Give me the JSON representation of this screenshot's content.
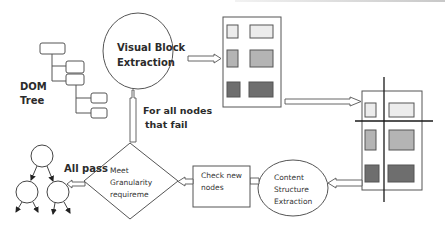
{
  "diagram": {
    "labels": {
      "dom_tree_line1": "DOM",
      "dom_tree_line2": "Tree",
      "visual_block_line1": "Visual Block",
      "visual_block_line2": "Extraction",
      "fail_line1": "For all nodes",
      "fail_line2": "that fail",
      "all_pass": "All pass",
      "diamond_line1": "Meet",
      "diamond_line2": "Granularity",
      "diamond_line3": "requireme",
      "check_line1": "Check new",
      "check_line2": "nodes",
      "content_line1": "Content",
      "content_line2": "Structure",
      "content_line3": "Extraction"
    },
    "nodes": [
      {
        "id": "dom-tree",
        "shape": "tree-boxes",
        "label": "DOM Tree"
      },
      {
        "id": "visual-block-extraction",
        "shape": "ellipse",
        "label": "Visual Block Extraction"
      },
      {
        "id": "layout-blocks",
        "shape": "page-with-blocks",
        "label": ""
      },
      {
        "id": "layout-separators",
        "shape": "page-with-separators",
        "label": ""
      },
      {
        "id": "content-structure-extraction",
        "shape": "ellipse",
        "label": "Content Structure Extraction"
      },
      {
        "id": "check-new-nodes",
        "shape": "rectangle",
        "label": "Check new nodes"
      },
      {
        "id": "granularity-check",
        "shape": "diamond",
        "label": "Meet Granularity requireme"
      },
      {
        "id": "content-tree",
        "shape": "tree-circles",
        "label": ""
      }
    ],
    "edges": [
      {
        "from": "visual-block-extraction",
        "to": "layout-blocks",
        "label": ""
      },
      {
        "from": "layout-blocks",
        "to": "layout-separators",
        "label": ""
      },
      {
        "from": "layout-separators",
        "to": "content-structure-extraction",
        "label": ""
      },
      {
        "from": "content-structure-extraction",
        "to": "check-new-nodes",
        "label": ""
      },
      {
        "from": "check-new-nodes",
        "to": "granularity-check",
        "label": ""
      },
      {
        "from": "granularity-check",
        "to": "content-tree",
        "label": "All pass"
      },
      {
        "from": "granularity-check",
        "to": "visual-block-extraction",
        "label": "For all nodes that fail"
      }
    ],
    "colors": {
      "stroke": "#5a5a5a",
      "block_light": "#ececec",
      "block_mid": "#b4b4b4",
      "block_dark": "#6e6e6e",
      "text": "#2b2b2b",
      "separator": "#1a1a1a"
    }
  }
}
